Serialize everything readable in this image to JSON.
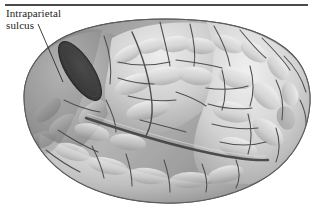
{
  "figure": {
    "type": "anatomical-illustration",
    "color_mode": "grayscale",
    "background_color": "#ffffff",
    "width_px": 317,
    "height_px": 215
  },
  "rule": {
    "name": "horizontal-divider",
    "color": "#4a4a4a"
  },
  "label": {
    "line1": "Intraparietal",
    "line2": "sulcus",
    "full_text": "Intraparietal sulcus",
    "text_color": "#1d1d1d"
  },
  "leader": {
    "name": "leader-line",
    "color": "#2b2b2b",
    "from_x": 38,
    "from_y": 24,
    "to_x": 63,
    "to_y": 82
  },
  "highlight": {
    "name": "intraparietal-sulcus-highlight",
    "shape": "ellipse",
    "fill_color": "#3a3a3a",
    "center_x": 80,
    "center_y": 71,
    "radius_x": 34,
    "radius_y": 13,
    "rotation_deg": 57
  },
  "palette": {
    "cortex_light": "#e6e6e6",
    "cortex_mid": "#b4b4b4",
    "cortex_dark": "#8c8c8c",
    "cortex_shadow": "#6d6d6d",
    "sulcus_line": "#4f4f4f",
    "outline": "#5a5a5a"
  }
}
